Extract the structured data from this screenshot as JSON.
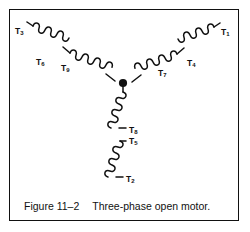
{
  "figure": {
    "caption_number": "Figure 11–2",
    "caption_text": "Three-phase open motor.",
    "border_color": "#111111",
    "background_color": "#ffffff",
    "line_color": "#111111"
  },
  "diagram": {
    "type": "wye-connected three-phase motor winding schematic",
    "junction_label": "center neutral junction dot",
    "branches": [
      {
        "name": "branch-left",
        "direction": "upper-left",
        "labels": [
          "T3",
          "T6",
          "T9"
        ]
      },
      {
        "name": "branch-right",
        "direction": "upper-right",
        "labels": [
          "T1",
          "T4",
          "T7"
        ]
      },
      {
        "name": "branch-bottom",
        "direction": "down",
        "labels": [
          "T8",
          "T5",
          "T2"
        ]
      }
    ]
  },
  "labels": {
    "t1": {
      "base": "T",
      "sub": "1"
    },
    "t2": {
      "base": "T",
      "sub": "2"
    },
    "t3": {
      "base": "T",
      "sub": "3"
    },
    "t4": {
      "base": "T",
      "sub": "4"
    },
    "t5": {
      "base": "T",
      "sub": "5"
    },
    "t6": {
      "base": "T",
      "sub": "6"
    },
    "t7": {
      "base": "T",
      "sub": "7"
    },
    "t8": {
      "base": "T",
      "sub": "8"
    },
    "t9": {
      "base": "T",
      "sub": "9"
    }
  }
}
